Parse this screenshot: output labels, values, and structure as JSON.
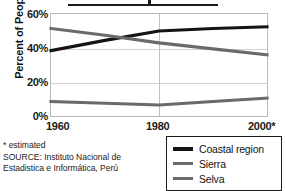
{
  "figure": {
    "title_cropped": true,
    "ylabel": "Percent of People"
  },
  "axes": {
    "yticks": [
      "60%",
      "40%",
      "20%",
      "0%"
    ],
    "ytick_values": [
      60,
      40,
      20,
      0
    ],
    "xticks": [
      "1960",
      "1980",
      "2000*"
    ],
    "xtick_values": [
      1960,
      1980,
      2000
    ]
  },
  "legend": {
    "items": [
      {
        "label": "Coastal region",
        "color": "#141414"
      },
      {
        "label": "Sierra",
        "color": "#6a6a6a"
      },
      {
        "label": "Selva",
        "color": "#6a6a6a"
      }
    ]
  },
  "footnote": {
    "line1": "* estimated",
    "line2": "SOURCE: Instituto Nacional de",
    "line3": "Estadistica e Informática, Perú"
  },
  "chart_data": {
    "type": "line",
    "title": "",
    "xlabel": "",
    "ylabel": "Percent of People",
    "xlim": [
      1960,
      2000
    ],
    "ylim": [
      0,
      60
    ],
    "grid": true,
    "legend_position": "bottom-right",
    "x": [
      1960,
      1970,
      1980,
      1990,
      2000
    ],
    "series": [
      {
        "name": "Coastal region",
        "color": "#141414",
        "values": [
          38.5,
          44.5,
          50.0,
          51.5,
          52.5
        ]
      },
      {
        "name": "Sierra",
        "color": "#6a6a6a",
        "values": [
          51.5,
          47.5,
          43.0,
          39.5,
          36.0
        ]
      },
      {
        "name": "Selva",
        "color": "#6a6a6a",
        "values": [
          8.5,
          7.5,
          6.5,
          8.5,
          10.5
        ]
      }
    ],
    "annotations": [
      "* estimated"
    ]
  }
}
